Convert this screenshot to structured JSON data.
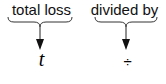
{
  "diagram": {
    "items": [
      {
        "label": "total loss",
        "symbol": "t",
        "symbol_style": "italic",
        "connector": "curly-brace-arrow-down"
      },
      {
        "label": "divided by",
        "symbol": "÷",
        "symbol_style": "normal",
        "connector": "curly-brace-arrow-down"
      }
    ],
    "colors": {
      "stroke": "#222222",
      "text": "#111111"
    }
  }
}
